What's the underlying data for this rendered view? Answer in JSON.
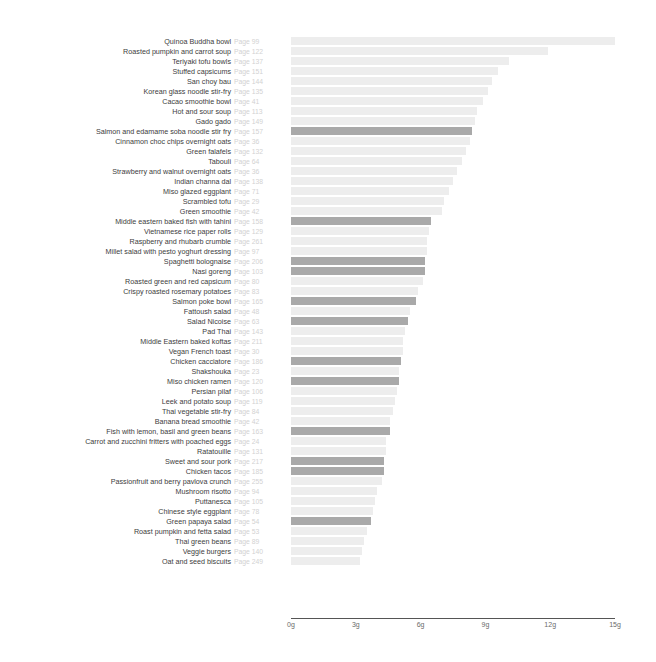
{
  "chart_data": {
    "type": "bar",
    "orientation": "horizontal",
    "title": "",
    "subtitle": "",
    "xlabel": "",
    "ylabel": "",
    "xlim": [
      0,
      15
    ],
    "unit": "g",
    "grid": false,
    "legend": null,
    "tick_labels": [
      "0g",
      "3g",
      "6g",
      "9g",
      "12g",
      "15g"
    ],
    "tick_values": [
      0,
      3,
      6,
      9,
      12,
      15
    ],
    "colors": {
      "bar_light": "#ededed",
      "bar_dark": "#a9a9a9",
      "axis": "#555555",
      "label_text": "#3d3d3d",
      "page_text": "#d2d2d2",
      "tick_text": "#6b6b6b",
      "background": "#ffffff"
    },
    "categories": [
      "Quinoa Buddha bowl",
      "Roasted pumpkin and carrot soup",
      "Teriyaki tofu bowls",
      "Stuffed capsicums",
      "San choy bau",
      "Korean glass noodle stir-fry",
      "Cacao smoothie bowl",
      "Hot and sour soup",
      "Gado gado",
      "Salmon and edamame soba noodle stir fry",
      "Cinnamon choc chips overnight oats",
      "Green falafels",
      "Tabouli",
      "Strawberry and walnut overnight oats",
      "Indian channa dal",
      "Miso glazed eggplant",
      "Scrambled tofu",
      "Green smoothie",
      "Middle eastern baked fish with tahini",
      "Vietnamese rice paper rolls",
      "Raspberry and rhubarb crumble",
      "Millet salad with pesto yoghurt dressing",
      "Spaghetti bolognaise",
      "Nasi goreng",
      "Roasted green and red capsicum",
      "Crispy roasted rosemary potatoes",
      "Salmon poke bowl",
      "Fattoush salad",
      "Salad Nicoise",
      "Pad Thai",
      "Middle Eastern baked koftas",
      "Vegan French toast",
      "Chicken cacciatore",
      "Shakshouka",
      "Miso chicken ramen",
      "Persian pilaf",
      "Leek and potato soup",
      "Thai vegetable stir-fry",
      "Banana bread smoothie",
      "Fish with lemon, basil and green beans",
      "Carrot and zucchini fritters with poached eggs",
      "Ratatouille",
      "Sweet and sour pork",
      "Chicken tacos",
      "Passionfruit and berry pavlova crunch",
      "Mushroom risotto",
      "Puttanesca",
      "Chinese style eggplant",
      "Green papaya salad",
      "Roast pumpkin and fetta salad",
      "Thai green beans",
      "Veggie burgers",
      "Oat and seed biscuits"
    ],
    "pages": [
      "Page 99",
      "Page 122",
      "Page 137",
      "Page 151",
      "Page 144",
      "Page 135",
      "Page 41",
      "Page 113",
      "Page 149",
      "Page 157",
      "Page 36",
      "Page 132",
      "Page 64",
      "Page 36",
      "Page 138",
      "Page 71",
      "Page 29",
      "Page 42",
      "Page 158",
      "Page 129",
      "Page 261",
      "Page 97",
      "Page 206",
      "Page 103",
      "Page 80",
      "Page 83",
      "Page 165",
      "Page 48",
      "Page 63",
      "Page 143",
      "Page 211",
      "Page 30",
      "Page 186",
      "Page 23",
      "Page 120",
      "Page 106",
      "Page 119",
      "Page 84",
      "Page 42",
      "Page 163",
      "Page 24",
      "Page 131",
      "Page 217",
      "Page 185",
      "Page 255",
      "Page 94",
      "Page 105",
      "Page 78",
      "Page 54",
      "Page 53",
      "Page 89",
      "Page 140",
      "Page 249"
    ],
    "values": [
      15.0,
      11.9,
      10.1,
      9.6,
      9.3,
      9.1,
      8.9,
      8.6,
      8.5,
      8.4,
      8.3,
      8.1,
      7.9,
      7.7,
      7.5,
      7.3,
      7.1,
      7.0,
      6.5,
      6.4,
      6.3,
      6.3,
      6.2,
      6.2,
      6.1,
      5.9,
      5.8,
      5.5,
      5.4,
      5.3,
      5.2,
      5.2,
      5.1,
      5.0,
      5.0,
      4.9,
      4.8,
      4.7,
      4.6,
      4.6,
      4.4,
      4.4,
      4.3,
      4.3,
      4.2,
      4.0,
      3.9,
      3.8,
      3.7,
      3.5,
      3.4,
      3.3,
      3.2
    ],
    "highlighted": [
      false,
      false,
      false,
      false,
      false,
      false,
      false,
      false,
      false,
      true,
      false,
      false,
      false,
      false,
      false,
      false,
      false,
      false,
      true,
      false,
      false,
      false,
      true,
      true,
      false,
      false,
      true,
      false,
      true,
      false,
      false,
      false,
      true,
      false,
      true,
      false,
      false,
      false,
      false,
      true,
      false,
      false,
      true,
      true,
      false,
      false,
      false,
      false,
      true,
      false,
      false,
      false,
      false
    ]
  }
}
